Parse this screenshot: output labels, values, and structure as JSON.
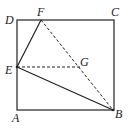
{
  "diagram": {
    "type": "geometry",
    "shape": "square ABCD",
    "points": {
      "A": {
        "label": "A",
        "x": 17,
        "y": 110
      },
      "B": {
        "label": "B",
        "x": 113,
        "y": 110
      },
      "C": {
        "label": "C",
        "x": 114,
        "y": 20
      },
      "D": {
        "label": "D",
        "x": 17,
        "y": 20
      },
      "E": {
        "label": "E",
        "x": 17,
        "y": 67
      },
      "F": {
        "label": "F",
        "x": 41,
        "y": 20
      },
      "G": {
        "label": "G",
        "x": 80,
        "y": 67
      }
    },
    "solid_segments": [
      "AB",
      "BC",
      "CD",
      "DA",
      "EF",
      "EB"
    ],
    "dashed_segments": [
      "FB",
      "EG"
    ],
    "colors": {
      "line": "#222222",
      "background": "#ffffff"
    }
  }
}
